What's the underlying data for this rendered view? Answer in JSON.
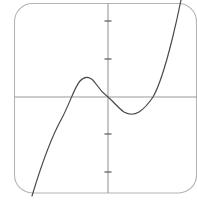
{
  "figure": {
    "title": "",
    "background_color": "#ffffff",
    "frame": {
      "name": "rounded-plot-frame",
      "x": 14,
      "y": 3,
      "width": 183,
      "height": 190,
      "corner_radius": 18,
      "stroke_color": "#b4b4b4",
      "stroke_width": 1.1
    }
  },
  "chart_data": {
    "type": "line",
    "title": "",
    "xlabel": "",
    "ylabel": "",
    "grid": false,
    "legend": null,
    "function": "cubic",
    "xlim": [
      -2.5,
      2.4
    ],
    "ylim": [
      -2.6,
      2.6
    ],
    "axes": {
      "x_axis": {
        "name": "x-axis",
        "pixel_y": 97,
        "color": "#9a9a9a",
        "stroke_width": 1.1,
        "ticks": []
      },
      "y_axis": {
        "name": "y-axis",
        "pixel_x": 108,
        "color": "#9a9a9a",
        "stroke_width": 1.1,
        "ticks": [
          {
            "value": 2,
            "pixel_y": 21
          },
          {
            "value": 1,
            "pixel_y": 59
          },
          {
            "value": -1,
            "pixel_y": 134
          },
          {
            "value": -2,
            "pixel_y": 172
          }
        ],
        "tick_length": 7,
        "tick_color": "#6e6e6e"
      }
    },
    "curve": {
      "name": "cubic-curve",
      "color": "#4a4a4a",
      "stroke_width": 1.2,
      "unit_px_x": 30,
      "unit_px_y": 37.5,
      "x": [
        -2.55,
        -2.3,
        -2.1,
        -1.9,
        -1.7,
        -1.53,
        -1.4,
        -1.2,
        -1.0,
        -0.9,
        -0.8,
        -0.6,
        -0.4,
        -0.2,
        0.0,
        0.2,
        0.4,
        0.6,
        0.8,
        1.0,
        1.2,
        1.4,
        1.5,
        1.7,
        1.9,
        2.1,
        2.25,
        2.4
      ],
      "y": [
        -2.85,
        -2.05,
        -1.45,
        -0.92,
        -0.46,
        -0.14,
        0.05,
        0.32,
        0.45,
        0.46,
        0.45,
        0.38,
        0.27,
        0.14,
        0.0,
        -0.14,
        -0.27,
        -0.38,
        -0.45,
        -0.46,
        -0.42,
        -0.26,
        -0.12,
        0.3,
        0.85,
        1.6,
        2.3,
        3.1
      ],
      "points_of_interest": [
        {
          "name": "left-x-intercept",
          "pixel_x": 62,
          "pixel_y": 97
        },
        {
          "name": "local-maximum",
          "pixel_x": 80,
          "pixel_y": 80
        },
        {
          "name": "origin-crossing",
          "pixel_x": 108,
          "pixel_y": 97
        },
        {
          "name": "local-minimum",
          "pixel_x": 132,
          "pixel_y": 114
        },
        {
          "name": "right-x-intercept",
          "pixel_x": 153,
          "pixel_y": 97
        }
      ],
      "path": "M 32,196 C 38,176 48,143 62,118 C 70,103 74,88 80,81 C 86,74 92,78 96,84 C 100,90 104,94 108,97 C 114,102 118,108 124,112 C 129,115 134,115 139,112 C 145,108 149,103 153,97 C 160,85 166,64 172,40 C 176,24 179,10 181,0"
    }
  }
}
